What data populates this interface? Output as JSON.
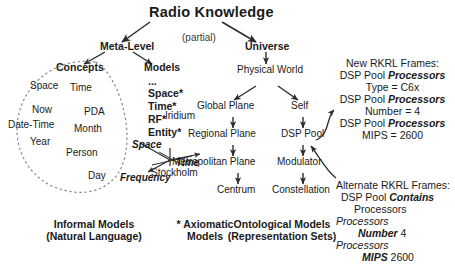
{
  "title": "Radio Knowledge",
  "partial_note": "(partial)",
  "branches": {
    "meta_level": "Meta-Level",
    "universe": "Universe"
  },
  "meta_level_children": {
    "concepts": "Concepts",
    "models": "Models"
  },
  "concepts_ellipse": {
    "items": [
      "Space",
      "Time",
      "Now",
      "PDA",
      "Date-Time",
      "Month",
      "Year",
      "Person",
      "Day"
    ]
  },
  "models_list": {
    "ellipsis": "...",
    "items": [
      "Space*",
      "Time*",
      "RF*",
      "Entity*"
    ]
  },
  "axes_icon": {
    "space": "Space",
    "time": "Time",
    "frequency": "Frequency"
  },
  "universe_chain": {
    "physical_world": "Physical World",
    "global_plane": "Global Plane",
    "self": "Self",
    "regional_plane": "Regional Plane",
    "dsp_pool": "DSP Pool",
    "metropolitan_plane": "Metropolitan Plane",
    "modulator": "Modulator",
    "centrum": "Centrum",
    "constellation": "Constellation"
  },
  "instance_labels": {
    "iridium": "Iridium",
    "stockholm": "Stockholm"
  },
  "new_frames": {
    "heading": "New RKRL Frames:",
    "lines": [
      {
        "prefix": "DSP Pool ",
        "bold": "Processors",
        "suffix": ""
      },
      {
        "prefix": "",
        "bold": "",
        "suffix": "Type = C6x"
      },
      {
        "prefix": "DSP Pool ",
        "bold": "Processors",
        "suffix": ""
      },
      {
        "prefix": "",
        "bold": "",
        "suffix": "Number = 4"
      },
      {
        "prefix": "DSP Pool ",
        "bold": "Processors",
        "suffix": ""
      },
      {
        "prefix": "",
        "bold": "",
        "suffix": "MIPS = 2600"
      }
    ]
  },
  "alternate_frames": {
    "heading": "Alternate RKRL Frames:",
    "l1_prefix": "DSP Pool ",
    "l1_bold": "Contains",
    "l2": "Processors",
    "l3_italic": "Processors",
    "l4_bold": "Number",
    "l4_value": "4",
    "l5_italic": "Processors",
    "l6_bold": "MIPS",
    "l6_value": "2600"
  },
  "captions": {
    "informal_line1": "Informal Models",
    "informal_line2": "(Natural Language)",
    "axiomatic_line1": "* Axiomatic",
    "axiomatic_line2": "Models",
    "ontological_line1": "Ontological Models",
    "ontological_line2": "(Representation Sets)"
  },
  "colors": {
    "ink": "#1a1a1a",
    "background": "#ffffff",
    "line": "#2b2b2b",
    "dashed": "#8a8a8a"
  }
}
